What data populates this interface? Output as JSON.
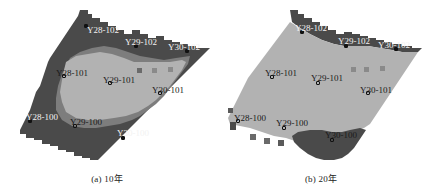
{
  "figure": {
    "panels": [
      {
        "id": "a",
        "caption": "(a)  10年",
        "wells": [
          {
            "label": "Y28-102",
            "x": 86,
            "y": 26,
            "lx": 87,
            "ly": 26,
            "theme": "light"
          },
          {
            "label": "Y29-102",
            "x": 136,
            "y": 46,
            "lx": 125,
            "ly": 38,
            "theme": "light"
          },
          {
            "label": "Y30-102",
            "x": 187,
            "y": 51,
            "lx": 168,
            "ly": 43,
            "theme": "light"
          },
          {
            "label": "Y28-101",
            "x": 64,
            "y": 76,
            "lx": 56,
            "ly": 69,
            "theme": "dark"
          },
          {
            "label": "Y29-101",
            "x": 110,
            "y": 83,
            "lx": 103,
            "ly": 76,
            "theme": "dark"
          },
          {
            "label": "Y30-101",
            "x": 160,
            "y": 93,
            "lx": 152,
            "ly": 86,
            "theme": "dark"
          },
          {
            "label": "Y28-100",
            "x": 30,
            "y": 121,
            "lx": 26,
            "ly": 113,
            "theme": "light"
          },
          {
            "label": "Y29-100",
            "x": 75,
            "y": 126,
            "lx": 70,
            "ly": 118,
            "theme": "dark"
          },
          {
            "label": "Y30-100",
            "x": 123,
            "y": 138,
            "lx": 117,
            "ly": 129,
            "theme": "light"
          }
        ]
      },
      {
        "id": "b",
        "caption": "(b)  20年",
        "wells": [
          {
            "label": "Y28-102",
            "x": 88,
            "y": 32,
            "lx": 81,
            "ly": 24,
            "theme": "light"
          },
          {
            "label": "Y29-102",
            "x": 132,
            "y": 46,
            "lx": 124,
            "ly": 37,
            "theme": "light"
          },
          {
            "label": "Y30-102",
            "x": 182,
            "y": 49,
            "lx": 164,
            "ly": 41,
            "theme": "light"
          },
          {
            "label": "Y28-101",
            "x": 58,
            "y": 77,
            "lx": 51,
            "ly": 69,
            "theme": "dark"
          },
          {
            "label": "Y29-101",
            "x": 104,
            "y": 83,
            "lx": 97,
            "ly": 74,
            "theme": "dark"
          },
          {
            "label": "Y30-101",
            "x": 154,
            "y": 93,
            "lx": 146,
            "ly": 86,
            "theme": "dark"
          },
          {
            "label": "Y28-100",
            "x": 24,
            "y": 121,
            "lx": 20,
            "ly": 114,
            "theme": "dark"
          },
          {
            "label": "Y29-100",
            "x": 70,
            "y": 128,
            "lx": 62,
            "ly": 119,
            "theme": "dark"
          },
          {
            "label": "Y30-100",
            "x": 118,
            "y": 140,
            "lx": 111,
            "ly": 131,
            "theme": "dark"
          }
        ]
      }
    ],
    "colors": {
      "dark_zone": "#4a4a4a",
      "mid_zone": "#7d7d7d",
      "light_zone": "#b2b2b2",
      "background": "#ffffff"
    }
  }
}
